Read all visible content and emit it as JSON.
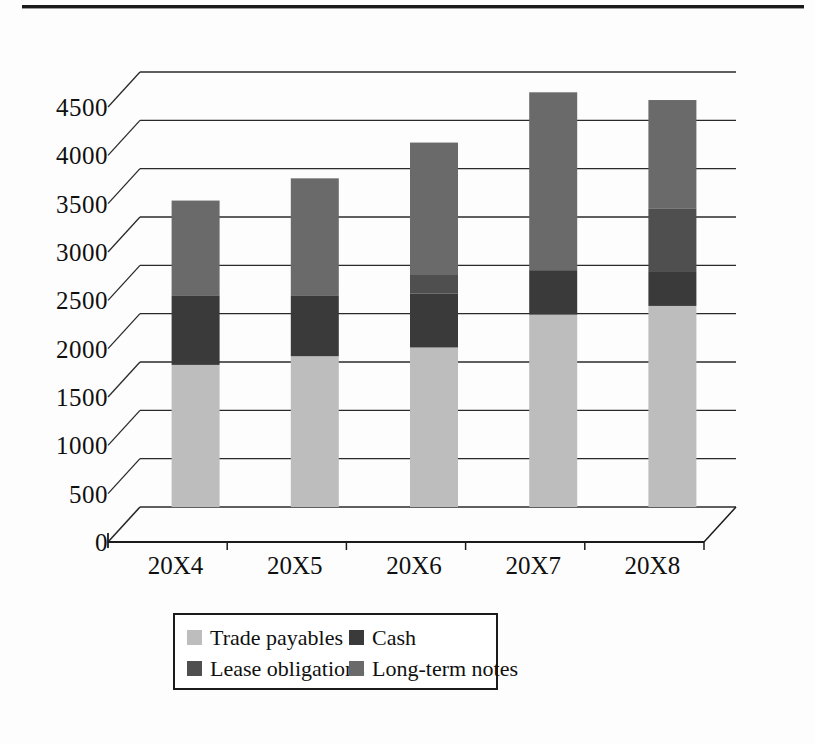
{
  "chart_data": {
    "type": "bar",
    "subtype": "stacked-column-3d",
    "title": "",
    "xlabel": "",
    "ylabel": "",
    "categories": [
      "20X4",
      "20X5",
      "20X6",
      "20X7",
      "20X8"
    ],
    "ylim": [
      0,
      4500
    ],
    "yticks": [
      0,
      500,
      1000,
      1500,
      2000,
      2500,
      3000,
      3500,
      4000,
      4500
    ],
    "ytick_labels": [
      "0",
      "500",
      "1000",
      "1500",
      "2000",
      "2500",
      "3000",
      "3500",
      "4000",
      "4500"
    ],
    "grid": true,
    "legend_position": "bottom",
    "series": [
      {
        "name": "Trade payables",
        "color": "#bdbdbd",
        "values": [
          1470,
          1560,
          1650,
          1990,
          2080
        ]
      },
      {
        "name": "Cash",
        "color": "#3a3a3a",
        "values": [
          720,
          630,
          560,
          460,
          360
        ]
      },
      {
        "name": "Lease obligations",
        "color": "#4f4f4f",
        "values": [
          0,
          0,
          190,
          0,
          650
        ]
      },
      {
        "name": "Long-term notes",
        "color": "#6a6a6a",
        "values": [
          980,
          1210,
          1370,
          1840,
          1120
        ]
      }
    ],
    "totals": [
      3170,
      3400,
      3770,
      4290,
      4210
    ]
  },
  "legend": {
    "entries": [
      {
        "label": "Trade payables",
        "color": "#bdbdbd"
      },
      {
        "label": "Cash",
        "color": "#3a3a3a"
      },
      {
        "label": "Lease obligations",
        "color": "#4f4f4f"
      },
      {
        "label": "Long-term notes",
        "color": "#6a6a6a"
      }
    ]
  },
  "colors": {
    "trade_payables": "#bdbdbd",
    "cash": "#3a3a3a",
    "lease_obligations": "#4f4f4f",
    "long_term_notes": "#6a6a6a",
    "axis": "#1b1b1b",
    "gridline": "#2a2a2a",
    "rule": "#1a1a1a"
  }
}
